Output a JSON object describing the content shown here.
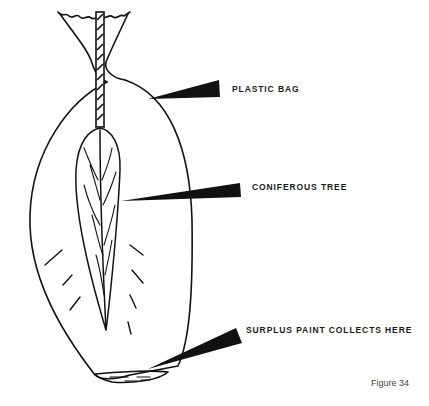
{
  "diagram": {
    "labels": {
      "plastic_bag": "PLASTIC BAG",
      "coniferous_tree": "CONIFEROUS TREE",
      "surplus_paint": "SURPLUS PAINT COLLECTS HERE"
    },
    "caption": "Figure 34",
    "colors": {
      "ink": "#111111",
      "background": "#ffffff",
      "caption": "#444444"
    }
  }
}
